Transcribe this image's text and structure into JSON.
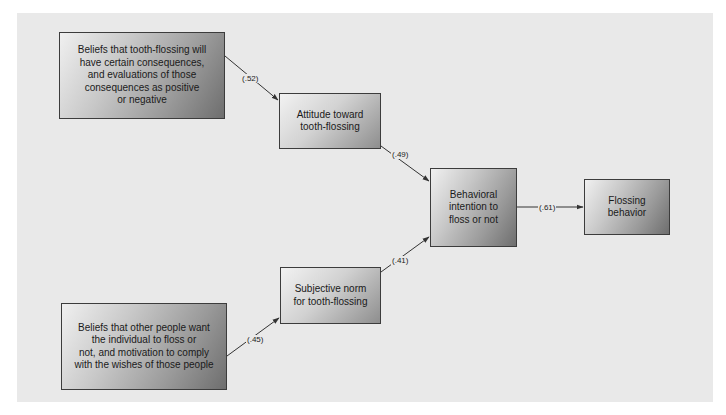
{
  "diagram": {
    "type": "path-diagram",
    "colors": {
      "panel": "#e9e9e9",
      "border": "#3c3c3c",
      "arrow": "#333333",
      "text": "#1a1a1a"
    },
    "nodes": {
      "behavioral_beliefs": "Beliefs that tooth-flossing will\nhave certain consequences,\nand evaluations of those\nconsequences as positive\nor negative",
      "attitude": "Attitude toward\ntooth-flossing",
      "normative_beliefs": "Beliefs that other people want\nthe individual to floss or\nnot, and motivation to comply\nwith the wishes of those people",
      "subjective_norm": "Subjective norm\nfor tooth-flossing",
      "intention": "Behavioral\nintention to\nfloss or not",
      "behavior": "Flossing\nbehavior"
    },
    "edges": {
      "beliefs_to_attitude": "(.52)",
      "attitude_to_intention": "(.49)",
      "normative_to_norm": "(.45)",
      "norm_to_intention": "(.41)",
      "intention_to_behavior": "(.61)"
    }
  }
}
